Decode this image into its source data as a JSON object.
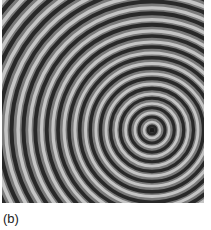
{
  "figure": {
    "label": "(b)",
    "center": {
      "x": 150,
      "y": 130
    },
    "colors": {
      "dark": "#1a1a1a",
      "light": "#d8d8d8",
      "mid": "#7a7a7a"
    }
  }
}
